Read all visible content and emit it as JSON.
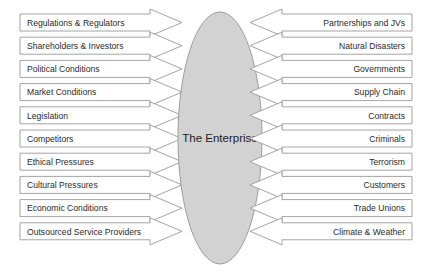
{
  "diagram": {
    "title": "The Enterprise",
    "center": {
      "label": "The Enterprise",
      "shape": "ellipse",
      "fill_color": "#d2d2d2",
      "border_color": "#9d9d9d"
    },
    "style": {
      "box_fill": "#ffffff",
      "box_border": "#9a9a9a",
      "text_color": "#2b2b2b",
      "background": "#ffffff"
    },
    "left_items": [
      {
        "label": "Regulations & Regulators"
      },
      {
        "label": "Shareholders & Investors"
      },
      {
        "label": "Political Conditions"
      },
      {
        "label": "Market Conditions"
      },
      {
        "label": "Legislation"
      },
      {
        "label": "Competitors"
      },
      {
        "label": "Ethical Pressures"
      },
      {
        "label": "Cultural Pressures"
      },
      {
        "label": "Economic Conditions"
      },
      {
        "label": "Outsourced Service Providers"
      }
    ],
    "right_items": [
      {
        "label": "Partnerships and JVs"
      },
      {
        "label": "Natural Disasters"
      },
      {
        "label": "Governments"
      },
      {
        "label": "Supply Chain"
      },
      {
        "label": "Contracts"
      },
      {
        "label": "Criminals"
      },
      {
        "label": "Terrorism"
      },
      {
        "label": "Customers"
      },
      {
        "label": "Trade Unions"
      },
      {
        "label": "Climate & Weather"
      }
    ]
  }
}
